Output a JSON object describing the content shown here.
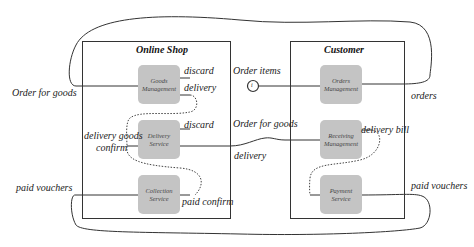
{
  "containers": {
    "shop": {
      "title": "Online Shop"
    },
    "customer": {
      "title": "Customer"
    }
  },
  "nodes": {
    "goods_management": {
      "line1": "Goods",
      "line2": "Management"
    },
    "delivery_service": {
      "line1": "Delivery",
      "line2": "Service"
    },
    "collection_service": {
      "line1": "Collection",
      "line2": "Service"
    },
    "orders_management": {
      "line1": "Orders",
      "line2": "Management"
    },
    "receiving_management": {
      "line1": "Receiving",
      "line2": "Management"
    },
    "payment_service": {
      "line1": "Payment",
      "line2": "Service"
    }
  },
  "interface_symbol": {
    "label": "Order items",
    "glyph": "i"
  },
  "edge_labels": {
    "order_for_goods_left": "Order for goods",
    "discard_goods": "discard",
    "delivery_goods": "delivery",
    "delivery_goods_confirm_1": "delivery goods",
    "delivery_goods_confirm_2": "confirm",
    "discard_delivery": "discard",
    "paid_vouchers_left": "paid vouchers",
    "paid_confirm": "paid confirm",
    "order_for_goods_mid": "Order for goods",
    "delivery_mid": "delivery",
    "orders": "orders",
    "delivery_bill": "delivery bill",
    "paid_vouchers_right": "paid vouchers"
  },
  "colors": {
    "node_fill": "#c4c4c4",
    "line": "#333333",
    "background": "#ffffff"
  }
}
